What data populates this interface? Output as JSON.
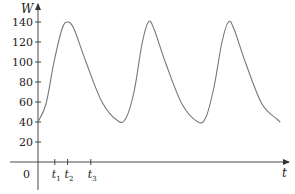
{
  "chart_data": {
    "type": "line",
    "title": "",
    "xlabel": "t",
    "ylabel": "W",
    "origin_label": "0",
    "ylim": [
      0,
      150
    ],
    "xlim": [
      0,
      3.1
    ],
    "y_ticks": [
      20,
      40,
      60,
      80,
      100,
      120,
      140
    ],
    "y_tick_labels": [
      "20",
      "40",
      "60",
      "80",
      "100",
      "120",
      "140"
    ],
    "x_tick_labels": [
      {
        "base": "t",
        "sub": "1",
        "x": 0.21
      },
      {
        "base": "t",
        "sub": "2",
        "x": 0.37
      },
      {
        "base": "t",
        "sub": "3",
        "x": 0.66
      }
    ],
    "grid": false,
    "legend": null,
    "series": [
      {
        "name": "W(t)",
        "color": "#777777",
        "description": "Periodic curve oscillating between 40 and 140",
        "x": [
          0.0,
          0.1,
          0.2,
          0.3,
          0.37,
          0.45,
          0.6,
          0.8,
          1.0,
          1.1,
          1.2,
          1.3,
          1.38,
          1.45,
          1.6,
          1.8,
          2.0,
          2.1,
          2.2,
          2.3,
          2.38,
          2.45,
          2.6,
          2.8,
          3.0,
          3.03
        ],
        "values": [
          40,
          58,
          100,
          133,
          140,
          133,
          100,
          60,
          41,
          44,
          70,
          118,
          140,
          133,
          98,
          58,
          40,
          45,
          75,
          120,
          140,
          133,
          98,
          58,
          42,
          40
        ]
      }
    ],
    "peaks": [
      {
        "t": 0.37,
        "W": 140
      },
      {
        "t": 1.38,
        "W": 140
      },
      {
        "t": 2.38,
        "W": 140
      }
    ],
    "troughs": [
      {
        "t": 1.0,
        "W": 40
      },
      {
        "t": 2.0,
        "W": 40
      }
    ]
  }
}
